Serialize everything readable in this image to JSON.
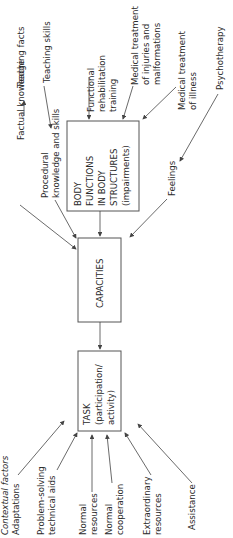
{
  "diagram": {
    "orientation": "rotated-90-ccw",
    "boxes": {
      "body_functions": [
        "BODY",
        "FUNCTIONS",
        "IN BODY",
        "STRUCTURES",
        "(impairments)"
      ],
      "capacities": "CAPACITIES",
      "task": [
        "TASK",
        "(participation/",
        "activity)"
      ]
    },
    "inputs_to_body_functions": {
      "functional_rehab": [
        "Functional",
        "rehabilitation",
        "training"
      ],
      "medical_injuries": [
        "Medical treatment",
        "of injuries and",
        "malformations"
      ],
      "medical_illness": [
        "Medical treatment",
        "of illness"
      ]
    },
    "inputs_to_capacities": {
      "factual": "Factual knowledge",
      "teaching_facts": "Teaching facts",
      "procedural": [
        "Procedural",
        "knowledge and skills"
      ],
      "teaching_skills": "Teaching skills",
      "feelings": "Feelings",
      "psychotherapy": "Psychotherapy"
    },
    "inputs_to_task": {
      "contextual": "Contextual factors",
      "adaptations": "Adaptations",
      "problem_solving": [
        "Problem-solving",
        "technical aids"
      ],
      "normal_resources": [
        "Normal",
        "resources"
      ],
      "normal_cooperation": [
        "Normal",
        "cooperation"
      ],
      "extraordinary": [
        "Extraordinary",
        "resources"
      ],
      "assistance": "Assistance"
    }
  }
}
